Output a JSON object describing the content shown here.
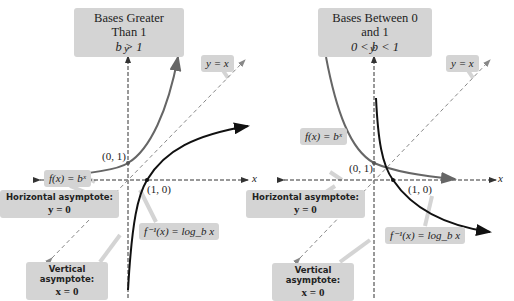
{
  "left_panel": {
    "title": "Bases Greater Than 1",
    "condition": "b > 1",
    "axis_x": "x",
    "axis_y": "y",
    "line_label": "y = x",
    "function_label": "f(x) = bˣ",
    "inverse_label": "f⁻¹(x) = log_b x",
    "point_fx": "(0, 1)",
    "point_inv": "(1, 0)",
    "horizontal_asymptote": {
      "title": "Horizontal asymptote:",
      "equation": "y = 0"
    },
    "vertical_asymptote": {
      "title": "Vertical asymptote:",
      "equation": "x = 0"
    }
  },
  "right_panel": {
    "title": "Bases Between 0 and 1",
    "condition": "0 < b < 1",
    "axis_x": "x",
    "axis_y": "y",
    "line_label": "y = x",
    "function_label": "f(x) = bˣ",
    "inverse_label": "f⁻¹(x) = log_b x",
    "point_fx": "(0, 1)",
    "point_inv": "(1, 0)",
    "horizontal_asymptote": {
      "title": "Horizontal asymptote:",
      "equation": "y = 0"
    },
    "vertical_asymptote": {
      "title": "Vertical asymptote:",
      "equation": "x = 0"
    }
  },
  "colors": {
    "exponential_curve": "#6b6b6b",
    "log_curve": "#1a1a1a",
    "label_box": "#d4d4d4",
    "axis": "#333333",
    "identity_line": "#888888"
  }
}
